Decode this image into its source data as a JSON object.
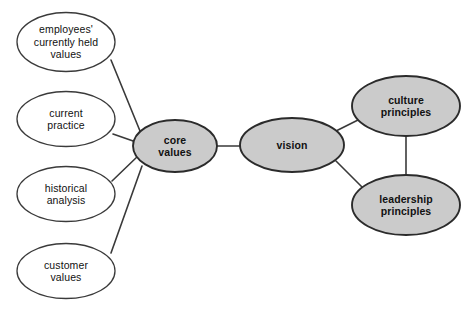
{
  "diagram": {
    "type": "concept-map",
    "background_color": "#ffffff",
    "style": {
      "shaded_fill": "#cbcbcb",
      "plain_fill": "#ffffff",
      "shaded_stroke": "#2b2b2b",
      "plain_stroke": "#3a3a3a",
      "edge_color": "#3a3a3a",
      "text_color": "#111111"
    },
    "nodes": [
      {
        "id": "employees-currently-held-values",
        "label": "employees'\ncurrently held\nvalues",
        "fill": "plain",
        "cx": 66,
        "cy": 42,
        "rx": 49,
        "ry": 29.5
      },
      {
        "id": "current-practice",
        "label": "current\npractice",
        "fill": "plain",
        "cx": 66,
        "cy": 119,
        "rx": 49,
        "ry": 27.5
      },
      {
        "id": "historical-analysis",
        "label": "historical\nanalysis",
        "fill": "plain",
        "cx": 66,
        "cy": 194,
        "rx": 49,
        "ry": 27.5
      },
      {
        "id": "customer-values",
        "label": "customer\nvalues",
        "fill": "plain",
        "cx": 66,
        "cy": 271,
        "rx": 49,
        "ry": 27.5
      },
      {
        "id": "core-values",
        "label": "core\nvalues",
        "fill": "shaded",
        "cx": 175,
        "cy": 146,
        "rx": 42,
        "ry": 26
      },
      {
        "id": "vision",
        "label": "vision",
        "fill": "shaded",
        "cx": 292,
        "cy": 145,
        "rx": 52,
        "ry": 27
      },
      {
        "id": "culture-principles",
        "label": "culture\nprinciples",
        "fill": "shaded",
        "cx": 406,
        "cy": 106,
        "rx": 54,
        "ry": 30
      },
      {
        "id": "leadership-principles",
        "label": "leadership\nprinciples",
        "fill": "shaded",
        "cx": 406,
        "cy": 205,
        "rx": 54,
        "ry": 30
      }
    ],
    "edges": [
      {
        "id": "edge-employees-to-core",
        "from": "employees-currently-held-values",
        "to": "core-values",
        "x1": 111,
        "y1": 60,
        "x2": 140,
        "y2": 131
      },
      {
        "id": "edge-practice-to-core",
        "from": "current-practice",
        "to": "core-values",
        "x1": 113,
        "y1": 134,
        "x2": 136,
        "y2": 142
      },
      {
        "id": "edge-historical-to-core",
        "from": "historical-analysis",
        "to": "core-values",
        "x1": 112,
        "y1": 181,
        "x2": 138,
        "y2": 156
      },
      {
        "id": "edge-customer-to-core",
        "from": "customer-values",
        "to": "core-values",
        "x1": 111,
        "y1": 253,
        "x2": 142,
        "y2": 166
      },
      {
        "id": "edge-core-to-vision",
        "from": "core-values",
        "to": "vision",
        "x1": 217,
        "y1": 146,
        "x2": 241,
        "y2": 146
      },
      {
        "id": "edge-vision-to-culture",
        "from": "vision",
        "to": "culture-principles",
        "x1": 336,
        "y1": 131,
        "x2": 360,
        "y2": 119
      },
      {
        "id": "edge-vision-to-leadership",
        "from": "vision",
        "to": "leadership-principles",
        "x1": 336,
        "y1": 161,
        "x2": 364,
        "y2": 189
      },
      {
        "id": "edge-culture-to-leadership",
        "from": "culture-principles",
        "to": "leadership-principles",
        "x1": 406,
        "y1": 136,
        "x2": 406,
        "y2": 175
      }
    ]
  }
}
